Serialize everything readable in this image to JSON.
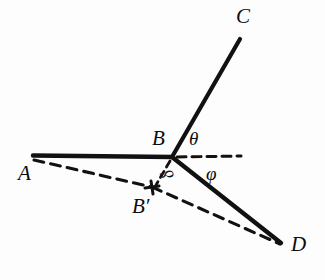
{
  "figure": {
    "kind": "geometry-diagram",
    "background_color": "#fdfdfd",
    "ink_color": "#111111",
    "width": 325,
    "height": 280
  },
  "points": {
    "A": {
      "label": "A",
      "x": 33,
      "y": 156,
      "label_x": 18,
      "label_y": 172
    },
    "B": {
      "label": "B",
      "x": 172,
      "y": 157,
      "label_x": 152,
      "label_y": 131
    },
    "C": {
      "label": "C",
      "x": 240,
      "y": 38,
      "label_x": 238,
      "label_y": 8
    },
    "D": {
      "label": "D",
      "x": 281,
      "y": 243,
      "label_x": 291,
      "label_y": 242
    },
    "Bprime": {
      "label": "B′",
      "x": 152,
      "y": 187,
      "label_x": 134,
      "label_y": 203
    }
  },
  "angles": {
    "theta": {
      "label": "θ",
      "x": 190,
      "y": 131
    },
    "phi": {
      "label": "φ",
      "x": 207,
      "y": 166
    },
    "delta": {
      "label": "δ",
      "x": 167,
      "y": 170
    }
  },
  "segments": {
    "solid": [
      {
        "name": "segment-AB",
        "from": "A",
        "to": "B",
        "x1": 33,
        "y1": 156,
        "x2": 172,
        "y2": 157
      },
      {
        "name": "segment-BC",
        "from": "B",
        "to": "C",
        "x1": 172,
        "y1": 157,
        "x2": 240,
        "y2": 39
      },
      {
        "name": "segment-BD",
        "from": "B",
        "to": "D",
        "x1": 172,
        "y1": 157,
        "x2": 281,
        "y2": 243
      }
    ],
    "dashed": [
      {
        "name": "segment-A-Bprime",
        "from": "A",
        "to": "B′",
        "x1": 34,
        "y1": 160,
        "x2": 152,
        "y2": 187
      },
      {
        "name": "segment-Bprime-D",
        "from": "B′",
        "to": "D",
        "x1": 152,
        "y1": 187,
        "x2": 280,
        "y2": 244
      },
      {
        "name": "reference-horizontal-from-B",
        "from": "B",
        "to": "reference",
        "x1": 176,
        "y1": 157,
        "x2": 241,
        "y2": 156
      },
      {
        "name": "segment-B-Bprime",
        "from": "B",
        "to": "B′",
        "x1": 170,
        "y1": 160,
        "x2": 155,
        "y2": 186
      }
    ]
  },
  "marks": {
    "bprime_cross": {
      "name": "bprime-cross-mark",
      "x": 152,
      "y": 187,
      "size": 6
    }
  }
}
